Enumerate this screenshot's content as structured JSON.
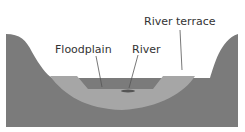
{
  "diagram": {
    "labels": {
      "floodplain": "Floodplain",
      "river": "River",
      "river_terrace": "River terrace"
    },
    "colors": {
      "bedrock": "#7b7b7b",
      "sediment": "#a6a6a6",
      "river": "#555555",
      "leader": "#555555"
    }
  }
}
